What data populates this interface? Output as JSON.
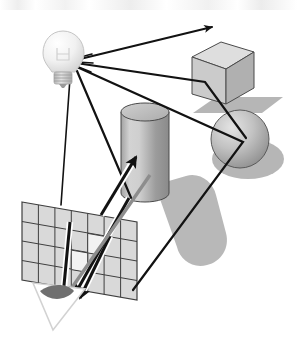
{
  "figure": {
    "caption": "",
    "background_color": "#ffffff",
    "width": 297,
    "height": 356
  },
  "palette": {
    "ray_stroke": "#121212",
    "outline": "#3a3a3a",
    "shadow_fill": "#b8b8b8",
    "cube_top": "#dcdcdc",
    "cube_front": "#c9c9c9",
    "cube_side": "#b0b0b0",
    "cylinder_light": "#d6d6d6",
    "cylinder_dark": "#8e8e8e",
    "cylinder_top": "#c4c4c4",
    "sphere_light": "#d9d9d9",
    "sphere_dark": "#8c8c8c",
    "grid_cell": "#d9d9d9",
    "grid_line": "#4a4a4a",
    "bulb_glass": "#f2f2f2",
    "bulb_base": "#c0c0c0",
    "eye_pupil": "#6f6f6f",
    "white": "#ffffff"
  },
  "scene": {
    "light_source": {
      "label": "light-bulb",
      "x": 63,
      "y": 58,
      "emits_rays": 5
    },
    "objects": [
      {
        "name": "cube",
        "label": "Cube",
        "x": 218,
        "y": 72,
        "has_shadow": true
      },
      {
        "name": "cylinder",
        "label": "Cylinder",
        "x": 144,
        "y": 155,
        "has_shadow": true
      },
      {
        "name": "sphere",
        "label": "Sphere",
        "x": 239,
        "y": 140,
        "has_shadow": true
      }
    ],
    "image_plane": {
      "label": "Image plane / pixel grid",
      "columns": 7,
      "rows": 4
    },
    "viewpoint": {
      "label": "Eye",
      "x": 56,
      "y": 298
    },
    "light_rays": [
      {
        "name": "ray-to-upper-right",
        "from": "light",
        "to": "upper-right",
        "arrow": true
      },
      {
        "name": "ray-to-cube",
        "from": "light",
        "to": "cube-front-face",
        "arrow": false
      },
      {
        "name": "ray-to-sphere",
        "from": "light",
        "to": "sphere-surface",
        "arrow": false
      },
      {
        "name": "ray-to-cylinder",
        "from": "light",
        "to": "cylinder-body",
        "arrow": false
      },
      {
        "name": "ray-to-grid",
        "from": "light",
        "to": "image-plane",
        "arrow": true
      }
    ],
    "view_rays": [
      {
        "name": "eye-ray-cylinder",
        "from": "eye",
        "through": "image-plane",
        "to": "cylinder",
        "arrow": true
      },
      {
        "name": "eye-ray-cube",
        "from": "eye",
        "through": "image-plane",
        "to": "cube",
        "arrow": true
      },
      {
        "name": "eye-ray-sphere",
        "from": "eye",
        "through": "image-plane",
        "to": "sphere",
        "arrow": true
      }
    ]
  }
}
